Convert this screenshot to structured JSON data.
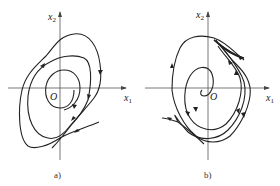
{
  "figure": {
    "panels": [
      {
        "id": "a",
        "caption": "a)",
        "x_axis_label": "x",
        "x_axis_sub": "1",
        "y_axis_label": "x",
        "y_axis_sub": "2",
        "origin_label": "O",
        "description": "Phase trajectories spiraling inward toward origin (stable focus-like behavior)"
      },
      {
        "id": "b",
        "caption": "b)",
        "x_axis_label": "x",
        "x_axis_sub": "1",
        "y_axis_label": "x",
        "y_axis_sub": "2",
        "origin_label": "O",
        "description": "Phase trajectories spiraling around origin with trajectories leaving outward"
      }
    ],
    "stroke_color": "#222222",
    "axis_color": "#555555"
  }
}
